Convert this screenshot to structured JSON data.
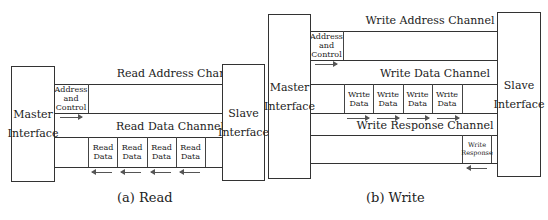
{
  "read": {
    "master_label_1": "Master",
    "master_label_2": "Interface",
    "slave_label_1": "Slave",
    "slave_label_2": "Interface",
    "address_channel": "Read Address Channel",
    "data_channel": "Read Data Channel",
    "address_cell": [
      "Address",
      "and",
      "Control"
    ],
    "data_cells": [
      {
        "l1": "Read",
        "l2": "Data"
      },
      {
        "l1": "Read",
        "l2": "Data"
      },
      {
        "l1": "Read",
        "l2": "Data"
      },
      {
        "l1": "Read",
        "l2": "Data"
      }
    ],
    "caption": "(a) Read"
  },
  "write": {
    "master_label_1": "Master",
    "master_label_2": "Interface",
    "slave_label_1": "Slave",
    "slave_label_2": "Interface",
    "address_channel": "Write Address Channel",
    "data_channel": "Write Data Channel",
    "response_channel": "Write Response Channel",
    "address_cell": [
      "Address",
      "and",
      "Control"
    ],
    "data_cells": [
      {
        "l1": "Write",
        "l2": "Data"
      },
      {
        "l1": "Write",
        "l2": "Data"
      },
      {
        "l1": "Write",
        "l2": "Data"
      },
      {
        "l1": "Write",
        "l2": "Data"
      }
    ],
    "response_cell": {
      "l1": "Write",
      "l2": "Response"
    },
    "caption": "(b) Write"
  }
}
